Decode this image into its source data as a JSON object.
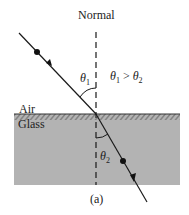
{
  "diagram": {
    "normal_label": "Normal",
    "theta1": "θ",
    "theta1_sub": "1",
    "theta2": "θ",
    "theta2_sub": "2",
    "relation": {
      "a": "θ",
      "a_sub": "1",
      "op": " > ",
      "b": "θ",
      "b_sub": "2"
    },
    "air_label": "Air",
    "glass_label": "Glass",
    "caption": "(a)",
    "colors": {
      "glass": "#b3b3b3",
      "line": "#1a1a1a",
      "text": "#222222"
    }
  }
}
